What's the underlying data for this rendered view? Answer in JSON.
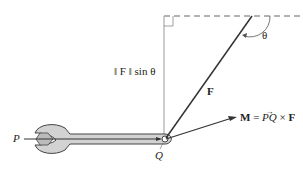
{
  "figure": {
    "labels": {
      "theta": "θ",
      "magnitude_term": "‖ F ‖ sin θ",
      "force": "F",
      "moment_lhs": "M",
      "moment_eq": "=",
      "moment_pq": "PQ",
      "moment_times": "×",
      "moment_f": "F",
      "point_p": "P",
      "point_q": "Q"
    },
    "colors": {
      "line": "#333333",
      "guide": "#999999",
      "wrench_fill": "#d0d0d0",
      "wrench_stroke": "#444444"
    }
  }
}
